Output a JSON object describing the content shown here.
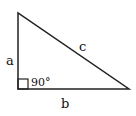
{
  "diagram": {
    "labels": {
      "side_a": "a",
      "side_b": "b",
      "side_c": "c",
      "angle": "90°"
    },
    "colors": {
      "stroke": "#222222",
      "text": "#111111",
      "background": "#ffffff"
    }
  }
}
